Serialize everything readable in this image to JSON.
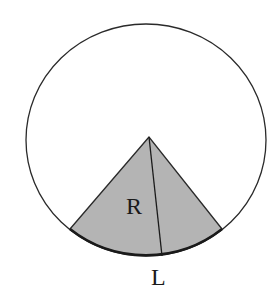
{
  "diagram": {
    "labels": {
      "radius": "R",
      "arc": "L"
    },
    "colors": {
      "background": "#ffffff",
      "stroke": "#2a2a2a",
      "sector_fill": "#b4b4b4"
    }
  }
}
